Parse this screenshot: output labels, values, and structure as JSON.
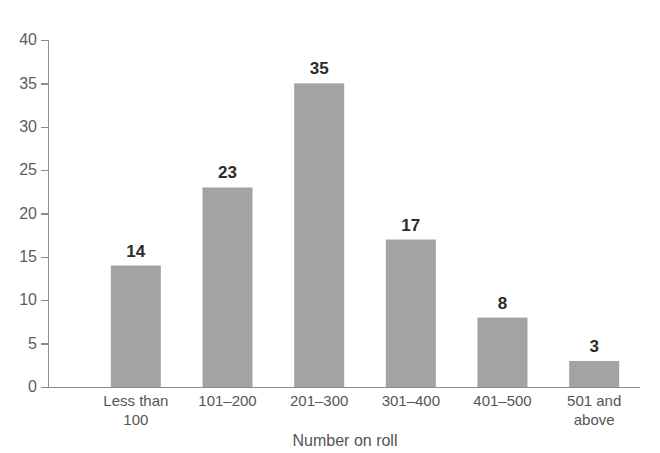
{
  "chart_data": {
    "type": "bar",
    "title": "",
    "subtitle": "",
    "xlabel": "Number on roll",
    "ylabel": "",
    "categories": [
      "Less than 100",
      "101–200",
      "201–300",
      "301–400",
      "401–500",
      "501 and above"
    ],
    "category_lines": [
      [
        "Less than",
        "100"
      ],
      [
        "101–200"
      ],
      [
        "201–300"
      ],
      [
        "301–400"
      ],
      [
        "401–500"
      ],
      [
        "501 and",
        "above"
      ]
    ],
    "values": [
      14,
      23,
      35,
      17,
      8,
      3
    ],
    "data_labels": [
      "14",
      "23",
      "35",
      "17",
      "8",
      "3"
    ],
    "ylim": [
      0,
      40
    ],
    "xlim": [
      0,
      6
    ],
    "y_ticks": [
      0,
      5,
      10,
      15,
      20,
      25,
      30,
      35,
      40
    ],
    "y_tick_labels": [
      "0",
      "5",
      "10",
      "15",
      "20",
      "25",
      "30",
      "35",
      "40"
    ],
    "x_ticks_visible": false,
    "grid": false,
    "legend": false,
    "legend_position": "none",
    "bar_color": "#a3a3a3",
    "axis_color": "#8d8d8d",
    "tick_label_color": "#5d5d5d",
    "data_label_color": "#2b2b2b",
    "background_color": "#ffffff"
  },
  "figure": {
    "width": 660,
    "height": 453,
    "plot_left": 48,
    "plot_right": 640,
    "plot_top": 40,
    "plot_bottom": 387
  }
}
